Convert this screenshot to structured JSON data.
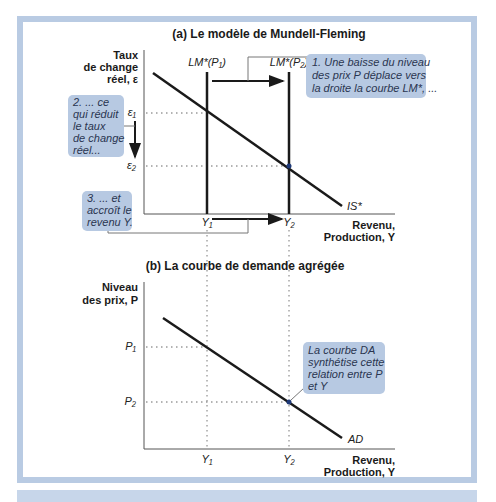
{
  "panel_a": {
    "title": "(a) Le modèle de Mundell-Fleming",
    "y_axis_label": [
      "Taux",
      "de change",
      "réel, ε"
    ],
    "x_axis_label": [
      "Revenu,",
      "Production, Y"
    ],
    "curves": {
      "lm1": "LM*(P₁)",
      "lm2": "LM*(P₂)",
      "is": "IS*"
    },
    "ticks_y": [
      "ε₁",
      "ε₂"
    ],
    "ticks_x": [
      "Y₁",
      "Y₂"
    ],
    "callout_1": [
      "1. Une baisse du niveau",
      "des prix P déplace vers",
      "la droite la courbe LM*, ..."
    ],
    "callout_2": [
      "2. ... ce",
      "qui réduit",
      "le taux",
      "de change",
      "réel..."
    ],
    "callout_3": [
      "3. ... et",
      "accroît le",
      "revenu Y."
    ]
  },
  "panel_b": {
    "title": "(b) La courbe de demande agrégée",
    "y_axis_label": [
      "Niveau",
      "des prix, P"
    ],
    "x_axis_label": [
      "Revenu,",
      "Production, Y"
    ],
    "curves": {
      "ad": "AD"
    },
    "ticks_y": [
      "P₁",
      "P₂"
    ],
    "ticks_x": [
      "Y₁",
      "Y₂"
    ],
    "callout": [
      "La courbe DA",
      "synthétise cette",
      "relation entre P",
      "et Y"
    ]
  },
  "colors": {
    "frame": "#b9cbe3",
    "callout_fill": "#b7c9e2",
    "line": "#1a1a1a",
    "point": "#1f3a78"
  }
}
